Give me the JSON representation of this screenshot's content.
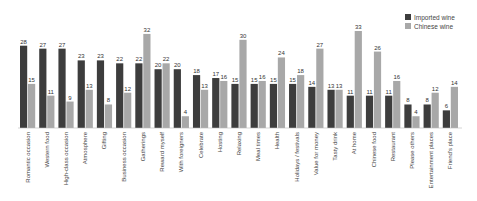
{
  "chart_data": {
    "type": "bar",
    "title": "",
    "xlabel": "",
    "ylabel": "",
    "ylim": [
      0,
      35
    ],
    "grid": false,
    "legend": "top-right",
    "categories": [
      "Romantic occasion",
      "Western food",
      "High-class occasion",
      "Atmosphere",
      "Gifting",
      "Business occasion",
      "Gatherings",
      "Reward myself",
      "With foreigners",
      "Celebrate",
      "Hosting",
      "Relaxing",
      "Meal times",
      "Health",
      "Holidays / festivals",
      "Value for money",
      "Tasty drink",
      "At home",
      "Chinese food",
      "Restaurant",
      "Please others",
      "Entertainment places",
      "Friend's place"
    ],
    "series": [
      {
        "name": "Imported wine",
        "color": "#3d3d3d",
        "values": [
          28,
          27,
          27,
          23,
          23,
          22,
          22,
          20,
          20,
          18,
          17,
          15,
          15,
          15,
          15,
          14,
          13,
          11,
          11,
          11,
          8,
          8,
          6
        ]
      },
      {
        "name": "Chinese wine",
        "color": "#a8a8a8",
        "values": [
          15,
          11,
          9,
          13,
          8,
          12,
          32,
          22,
          4,
          13,
          16,
          30,
          16,
          24,
          18,
          27,
          13,
          33,
          26,
          16,
          4,
          12,
          14
        ]
      }
    ]
  }
}
